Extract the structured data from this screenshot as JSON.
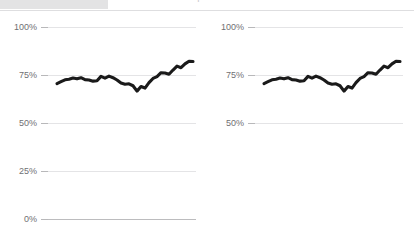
{
  "header": {
    "title": "Line chart comparison",
    "block_color": "#e3e3e4",
    "rule_color": "#dedee0"
  },
  "theme": {
    "line_color": "#1a1a1a",
    "grid_color": "#e4e4e6",
    "axis_color": "#bcbcbe",
    "label_color": "#6f6f73",
    "background": "#ffffff"
  },
  "chart_data": [
    {
      "type": "line",
      "id": "chart-left",
      "title": "",
      "xlabel": "",
      "ylabel": "",
      "ylim": [
        0,
        100
      ],
      "grid": true,
      "legend": "none",
      "yticks": [
        0,
        25,
        50,
        75,
        100
      ],
      "ytick_labels": [
        "0%",
        "25%",
        "50%",
        "75%",
        "100%"
      ],
      "x": [
        0,
        1,
        2,
        3,
        4,
        5,
        6,
        7,
        8,
        9,
        10,
        11,
        12,
        13,
        14,
        15,
        16,
        17,
        18,
        19,
        20,
        21,
        22,
        23,
        24,
        25,
        26,
        27,
        28,
        29,
        30,
        31,
        32,
        33,
        34
      ],
      "series": [
        {
          "name": "series-1",
          "color": "#1a1a1a",
          "values": [
            70.5,
            71.5,
            72.5,
            72.8,
            73.4,
            73.0,
            73.6,
            72.6,
            72.4,
            71.8,
            72.0,
            74.3,
            73.4,
            74.4,
            73.6,
            72.4,
            70.8,
            70.2,
            70.4,
            69.4,
            66.6,
            69.0,
            68.2,
            71.0,
            73.2,
            74.2,
            76.2,
            76.0,
            75.4,
            77.6,
            79.6,
            78.8,
            80.8,
            82.2,
            82.0
          ]
        }
      ]
    },
    {
      "type": "line",
      "id": "chart-right",
      "title": "",
      "xlabel": "",
      "ylabel": "",
      "ylim": [
        0,
        100
      ],
      "grid": true,
      "legend": "none",
      "yticks": [
        50,
        75,
        100
      ],
      "ytick_labels": [
        "50%",
        "75%",
        "100%"
      ],
      "x": [
        0,
        1,
        2,
        3,
        4,
        5,
        6,
        7,
        8,
        9,
        10,
        11,
        12,
        13,
        14,
        15,
        16,
        17,
        18,
        19,
        20,
        21,
        22,
        23,
        24,
        25,
        26,
        27,
        28,
        29,
        30,
        31,
        32,
        33,
        34
      ],
      "series": [
        {
          "name": "series-1",
          "color": "#1a1a1a",
          "values": [
            70.5,
            71.5,
            72.5,
            72.8,
            73.4,
            73.0,
            73.6,
            72.6,
            72.4,
            71.8,
            72.0,
            74.3,
            73.4,
            74.4,
            73.6,
            72.4,
            70.8,
            70.2,
            70.4,
            69.4,
            66.6,
            69.0,
            68.2,
            71.0,
            73.2,
            74.2,
            76.2,
            76.0,
            75.4,
            77.6,
            79.6,
            78.8,
            80.8,
            82.2,
            82.0
          ]
        }
      ]
    }
  ]
}
